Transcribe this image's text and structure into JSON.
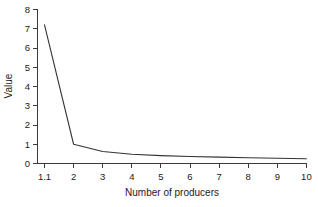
{
  "chart_data": {
    "type": "line",
    "title": "",
    "xlabel": "Number of producers",
    "ylabel": "Value",
    "x_tick_labels": [
      "1.1",
      "2",
      "3",
      "4",
      "5",
      "6",
      "7",
      "8",
      "9",
      "10"
    ],
    "y_tick_labels": [
      "0",
      "1",
      "2",
      "3",
      "4",
      "5",
      "6",
      "7",
      "8"
    ],
    "categories": [
      "1.1",
      "2",
      "3",
      "4",
      "5",
      "6",
      "7",
      "8",
      "9",
      "10"
    ],
    "values": [
      7.2,
      1.0,
      0.62,
      0.48,
      0.41,
      0.36,
      0.33,
      0.3,
      0.27,
      0.25
    ],
    "series": [
      {
        "name": "Value",
        "values": [
          7.2,
          1.0,
          0.62,
          0.48,
          0.41,
          0.36,
          0.33,
          0.3,
          0.27,
          0.25
        ]
      }
    ],
    "ylim": [
      0,
      8
    ],
    "xlim": [
      0,
      9
    ],
    "grid": false,
    "legend": false,
    "line_color": "#343434",
    "background_color": "#ffffff"
  },
  "axes": {
    "y_axis_label": "Value",
    "x_axis_label": "Number of producers"
  }
}
